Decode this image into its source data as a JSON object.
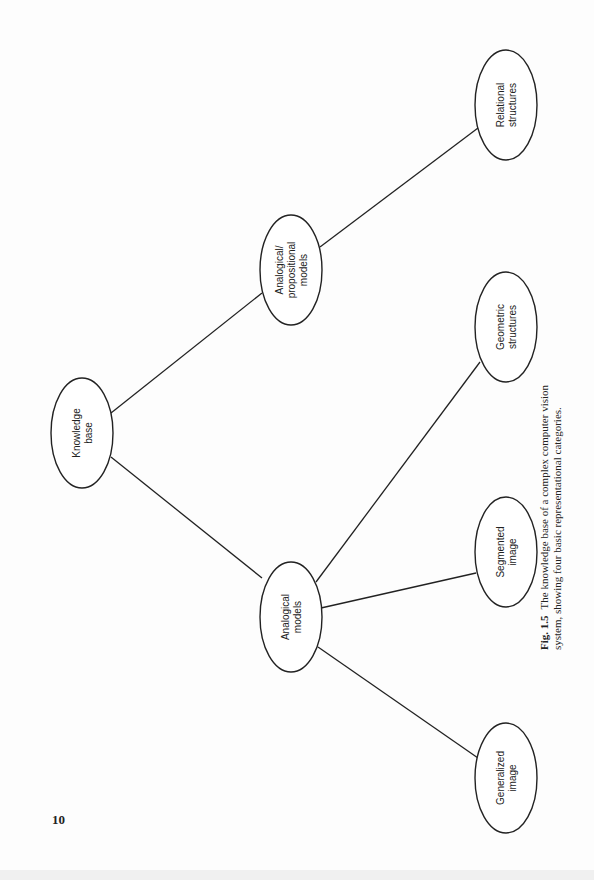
{
  "page_number": "10",
  "caption": {
    "figure_label": "Fig. 1.5",
    "text": "The knowledge base of a complex computer vision system, showing four basic representational categories."
  },
  "nodes": {
    "knowledge_base": {
      "line1": "Knowledge",
      "line2": "base"
    },
    "analogical_propositional": {
      "line1": "Analogical/",
      "line2": "propositional",
      "line3": "models"
    },
    "analogical_models": {
      "line1": "Analogical",
      "line2": "models"
    },
    "relational_structures": {
      "line1": "Relational",
      "line2": "structures"
    },
    "geometric_structures": {
      "line1": "Geometric",
      "line2": "structures"
    },
    "segmented_image": {
      "line1": "Segmented",
      "line2": "image"
    },
    "generalized_image": {
      "line1": "Generalized",
      "line2": "image"
    }
  },
  "edges": [
    [
      "Knowledge base",
      "Analogical/propositional models"
    ],
    [
      "Knowledge base",
      "Analogical models"
    ],
    [
      "Analogical/propositional models",
      "Relational structures"
    ],
    [
      "Analogical models",
      "Geometric structures"
    ],
    [
      "Analogical models",
      "Segmented image"
    ],
    [
      "Analogical models",
      "Generalized image"
    ]
  ]
}
